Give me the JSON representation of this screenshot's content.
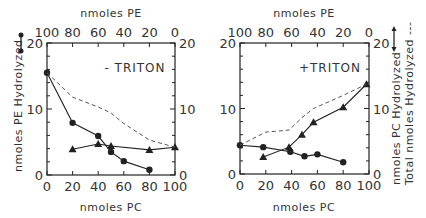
{
  "chart_data": [
    {
      "type": "line",
      "panel_label": "- TRITON",
      "xlabel": "nmoles PC",
      "x2label": "nmoles PE",
      "ylabel": "nmoles PE Hydrolyzed",
      "xlim": [
        0,
        100
      ],
      "ylim": [
        0,
        20
      ],
      "x_ticks": [
        "0",
        "20",
        "40",
        "60",
        "80",
        "100"
      ],
      "x2_ticks": [
        "100",
        "80",
        "60",
        "40",
        "20",
        "0"
      ],
      "y_ticks": [
        "0",
        "10",
        "20"
      ],
      "y2_ticks": [
        "0",
        "10",
        "20"
      ],
      "grid": false,
      "series": [
        {
          "name": "nmoles PE Hydrolyzed",
          "marker": "circle",
          "style": "solid",
          "x": [
            0,
            20,
            40,
            50,
            60,
            80
          ],
          "y": [
            15.5,
            7.9,
            5.9,
            3.5,
            2.1,
            0.8
          ]
        },
        {
          "name": "nmoles PC Hydrolyzed",
          "marker": "triangle",
          "style": "solid",
          "x": [
            20,
            40,
            50,
            80,
            100
          ],
          "y": [
            3.9,
            4.7,
            4.4,
            3.8,
            4.2
          ]
        },
        {
          "name": "Total nmoles Hydrolyzed",
          "marker": "none",
          "style": "dashed",
          "x": [
            0,
            20,
            40,
            50,
            60,
            80,
            100
          ],
          "y": [
            15.5,
            11.8,
            10.3,
            9.4,
            7.8,
            5.3,
            4.2
          ]
        }
      ]
    },
    {
      "type": "line",
      "panel_label": "+TRITON",
      "xlabel": "nmoles PC",
      "x2label": "nmoles PE",
      "ylabel": "nmoles PC Hydrolyzed",
      "ylabel2": "Total nmoles Hydrolyzed ---",
      "xlim": [
        0,
        100
      ],
      "ylim": [
        0,
        20
      ],
      "x_ticks": [
        "0",
        "20",
        "40",
        "60",
        "80",
        "100"
      ],
      "x2_ticks": [
        "100",
        "80",
        "60",
        "40",
        "20",
        "0"
      ],
      "y_ticks": [
        "0",
        "10",
        "20"
      ],
      "y2_ticks": [
        "0",
        "10",
        "20"
      ],
      "grid": false,
      "series": [
        {
          "name": "nmoles PE Hydrolyzed",
          "marker": "circle",
          "style": "solid",
          "x": [
            0,
            18,
            39,
            50,
            60,
            80
          ],
          "y": [
            4.4,
            4.1,
            3.4,
            2.7,
            3.0,
            1.8
          ]
        },
        {
          "name": "nmoles PC Hydrolyzed",
          "marker": "triangle",
          "style": "solid",
          "x": [
            18,
            38,
            48,
            57,
            80,
            98
          ],
          "y": [
            2.6,
            4.1,
            6.0,
            7.9,
            10.2,
            13.7
          ]
        },
        {
          "name": "Total nmoles Hydrolyzed",
          "marker": "none",
          "style": "dashed",
          "x": [
            0,
            20,
            38,
            48,
            57,
            80,
            98
          ],
          "y": [
            4.4,
            6.4,
            6.7,
            8.6,
            10.0,
            12.0,
            13.7
          ]
        }
      ]
    }
  ],
  "labels": {
    "left": {
      "panel": "- TRITON",
      "top_title": "nmoles PE",
      "bottom_title": "nmoles PC",
      "y_title": "nmoles PE Hydrolyzed"
    },
    "right": {
      "panel": "+TRITON",
      "top_title": "nmoles PE",
      "bottom_title": "nmoles PC",
      "y_title": "nmoles PC Hydrolyzed",
      "y2_title": "Total nmoles Hydrolyzed ---"
    }
  },
  "colors": {
    "ink": "#222222",
    "dashed": "#555555",
    "background": "#ffffff"
  }
}
